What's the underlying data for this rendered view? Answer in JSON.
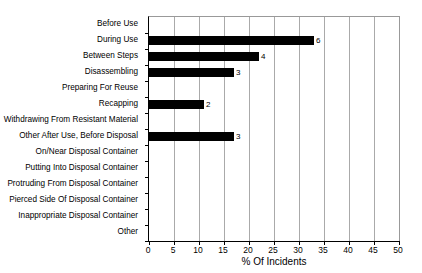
{
  "chart_data": {
    "type": "bar",
    "orientation": "horizontal",
    "title": "",
    "xlabel": "% Of Incidents",
    "ylabel": "",
    "xlim": [
      0,
      50
    ],
    "xticks": [
      0,
      5,
      10,
      15,
      20,
      25,
      30,
      35,
      40,
      45,
      50
    ],
    "grid": true,
    "legend": false,
    "bar_color": "#000000",
    "categories": [
      "Before Use",
      "During Use",
      "Between Steps",
      "Disassembling",
      "Preparing For Reuse",
      "Recapping",
      "Withdrawing From Resistant Material",
      "Other After Use, Before Disposal",
      "On/Near Disposal Container",
      "Putting Into Disposal Container",
      "Protruding From Disposal Container",
      "Pierced Side Of Disposal Container",
      "Inappropriate Disposal Container",
      "Other"
    ],
    "values": [
      0,
      33,
      22,
      17,
      0,
      11,
      0,
      17,
      0,
      0,
      0,
      0,
      0,
      0
    ],
    "data_labels": [
      "",
      "6",
      "4",
      "3",
      "",
      "2",
      "",
      "3",
      "",
      "",
      "",
      "",
      "",
      ""
    ]
  }
}
